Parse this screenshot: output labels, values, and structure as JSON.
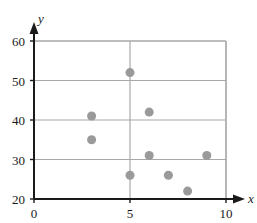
{
  "chart_data": {
    "type": "scatter",
    "title": "",
    "subtitle": "",
    "xlabel": "x",
    "ylabel": "y",
    "xlim": [
      0,
      10
    ],
    "ylim": [
      20,
      60
    ],
    "xticks": [
      0,
      5,
      10
    ],
    "yticks": [
      20,
      30,
      40,
      50,
      60
    ],
    "xtick_labels": [
      "0",
      "5",
      "10"
    ],
    "ytick_labels": [
      "20",
      "30",
      "40",
      "50",
      "60"
    ],
    "grid": {
      "horizontal": true,
      "vertical": true,
      "horizontal_at": [
        30,
        40,
        50,
        60
      ],
      "vertical_at": [
        5,
        10
      ],
      "color": "#a8a8a8"
    },
    "legend": null,
    "annotations": [],
    "marker": {
      "shape": "circle",
      "color": "#9a9a9a",
      "size": 6
    },
    "points": [
      {
        "x": 3,
        "y": 41
      },
      {
        "x": 3,
        "y": 35
      },
      {
        "x": 5,
        "y": 52
      },
      {
        "x": 5,
        "y": 26
      },
      {
        "x": 6,
        "y": 42
      },
      {
        "x": 6,
        "y": 31
      },
      {
        "x": 7,
        "y": 26
      },
      {
        "x": 8,
        "y": 22
      },
      {
        "x": 9,
        "y": 31
      }
    ],
    "axis_style": {
      "arrow_tipped": true,
      "axis_color": "#1a1a1a",
      "frame_color": "#a8a8a8"
    }
  },
  "axis_labels": {
    "x_name": "x",
    "y_name": "y",
    "y_60": "60",
    "y_50": "50",
    "y_40": "40",
    "y_30": "30",
    "y_20": "20",
    "x_0": "0",
    "x_5": "5",
    "x_10": "10"
  }
}
